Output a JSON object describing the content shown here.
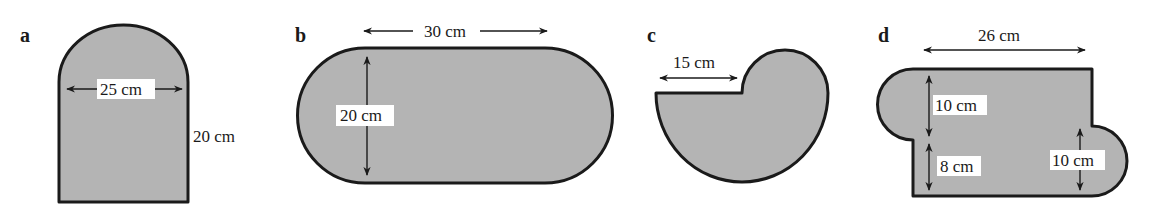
{
  "figures": [
    {
      "letter": "a",
      "description": "rectangle with semicircular top",
      "labels": {
        "width": "25 cm",
        "height": "20 cm"
      }
    },
    {
      "letter": "b",
      "description": "rectangle with semicircular ends (stadium)",
      "labels": {
        "length": "30 cm",
        "height": "20 cm"
      }
    },
    {
      "letter": "c",
      "description": "large semicircle with small semicircle on top right",
      "labels": {
        "radius": "15 cm"
      }
    },
    {
      "letter": "d",
      "description": "rectangle with semicircles on left-top and right-bottom",
      "labels": {
        "width": "26 cm",
        "left_semicircle": "10 cm",
        "left_lower": "8 cm",
        "right_semicircle": "10 cm"
      }
    }
  ],
  "colors": {
    "fill": "#b4b4b4",
    "stroke": "#1a1a1a",
    "background": "#ffffff"
  }
}
